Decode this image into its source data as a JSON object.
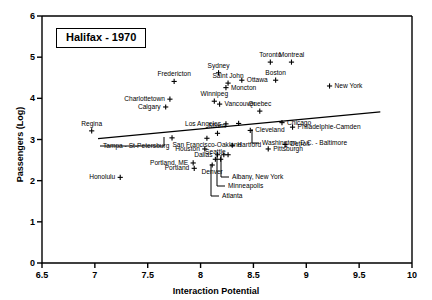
{
  "title": "Halifax - 1970",
  "chart_data": {
    "type": "scatter",
    "title": "Halifax - 1970",
    "xlabel": "Interaction Potential",
    "ylabel": "Passengers (Log)",
    "xlim": [
      6.5,
      10
    ],
    "ylim": [
      0,
      6
    ],
    "xticks": [
      "6.5",
      "7",
      "7.5",
      "8",
      "8.5",
      "9",
      "9.5",
      "10"
    ],
    "xtick_values": [
      6.5,
      7,
      7.5,
      8,
      8.5,
      9,
      9.5,
      10
    ],
    "yticks": [
      "0",
      "1",
      "2",
      "3",
      "4",
      "5",
      "6"
    ],
    "ytick_values": [
      0,
      1,
      2,
      3,
      4,
      5,
      6
    ],
    "grid": false,
    "legend": false,
    "marker": "plus",
    "marker_color": "#000000",
    "trend_line": {
      "x": [
        7.03,
        9.7
      ],
      "y": [
        3.02,
        3.67
      ]
    },
    "points": [
      {
        "name": "Sydney",
        "x": 8.17,
        "y": 4.62,
        "label_pos": "above"
      },
      {
        "name": "Toronto",
        "x": 8.66,
        "y": 4.88,
        "label_pos": "above"
      },
      {
        "name": "Montreal",
        "x": 8.86,
        "y": 4.88,
        "label_pos": "above"
      },
      {
        "name": "Boston",
        "x": 8.71,
        "y": 4.44,
        "label_pos": "above"
      },
      {
        "name": "Fredericton",
        "x": 7.75,
        "y": 4.41,
        "label_pos": "above"
      },
      {
        "name": "Saint John",
        "x": 8.26,
        "y": 4.37,
        "label_pos": "above"
      },
      {
        "name": "Ottawa",
        "x": 8.39,
        "y": 4.44,
        "label_pos": "right"
      },
      {
        "name": "Moncton",
        "x": 8.24,
        "y": 4.26,
        "label_pos": "right"
      },
      {
        "name": "New York",
        "x": 9.22,
        "y": 4.3,
        "label_pos": "right"
      },
      {
        "name": "Charlottetown",
        "x": 7.71,
        "y": 3.98,
        "label_pos": "left"
      },
      {
        "name": "Winnipeg",
        "x": 8.13,
        "y": 3.93,
        "label_pos": "above"
      },
      {
        "name": "Vancouver",
        "x": 8.18,
        "y": 3.86,
        "label_pos": "right"
      },
      {
        "name": "Calgary",
        "x": 7.67,
        "y": 3.79,
        "label_pos": "left"
      },
      {
        "name": "Quebec",
        "x": 8.56,
        "y": 3.69,
        "label_pos": "above"
      },
      {
        "name": "Chicago",
        "x": 8.77,
        "y": 3.41,
        "label_pos": "right"
      },
      {
        "name": "Philadelphie-Camden",
        "x": 8.87,
        "y": 3.3,
        "label_pos": "right"
      },
      {
        "name": "Los Angeles",
        "x": 8.24,
        "y": 3.38,
        "label_pos": "left"
      },
      {
        "name": "Regina",
        "x": 6.97,
        "y": 3.21,
        "label_pos": "above"
      },
      {
        "name": "Washington, D.C. - Baltimore",
        "x": 8.36,
        "y": 3.39,
        "label_pos": "leader"
      },
      {
        "name": "Cleveland",
        "x": 8.47,
        "y": 3.22,
        "label_pos": "right"
      },
      {
        "name": "Tampa - St-Petersburg",
        "x": 7.73,
        "y": 3.04,
        "label_pos": "leader"
      },
      {
        "name": "San Francisco-Oakland",
        "x": 8.06,
        "y": 3.03,
        "label_pos": "below"
      },
      {
        "name": "Miami",
        "x": 8.16,
        "y": 3.15,
        "label_pos": "above"
      },
      {
        "name": "Hartford",
        "x": 8.3,
        "y": 2.86,
        "label_pos": "right"
      },
      {
        "name": "Detroit",
        "x": 8.8,
        "y": 2.88,
        "label_pos": "right"
      },
      {
        "name": "Pittsburgh",
        "x": 8.64,
        "y": 2.77,
        "label_pos": "right"
      },
      {
        "name": "Houston",
        "x": 8.04,
        "y": 2.77,
        "label_pos": "left"
      },
      {
        "name": "Dallas",
        "x": 8.16,
        "y": 2.63,
        "label_pos": "left"
      },
      {
        "name": "Seattle",
        "x": 8.14,
        "y": 2.52,
        "label_pos": "above"
      },
      {
        "name": "Denver",
        "x": 8.11,
        "y": 2.38,
        "label_pos": "below"
      },
      {
        "name": "Portland, ME",
        "x": 7.93,
        "y": 2.43,
        "label_pos": "left"
      },
      {
        "name": "Portland",
        "x": 7.94,
        "y": 2.3,
        "label_pos": "left"
      },
      {
        "name": "Honolulu",
        "x": 7.24,
        "y": 2.08,
        "label_pos": "left"
      },
      {
        "name": "Albany, New York",
        "x": 8.26,
        "y": 2.63,
        "label_pos": "leader"
      },
      {
        "name": "Minneapolis",
        "x": 8.22,
        "y": 2.63,
        "label_pos": "leader"
      },
      {
        "name": "Atlanta",
        "x": 8.19,
        "y": 2.52,
        "label_pos": "leader"
      }
    ]
  }
}
